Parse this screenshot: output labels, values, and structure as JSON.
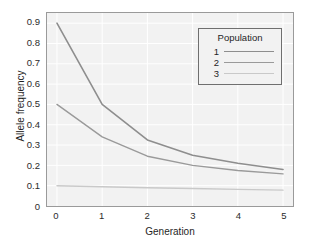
{
  "chart_data": {
    "type": "line",
    "title": "",
    "subtitle": "",
    "xlabel": "Generation",
    "ylabel": "Allele frequency",
    "x": [
      0,
      1,
      2,
      3,
      4,
      5
    ],
    "xticks": [
      "0",
      "1",
      "2",
      "3",
      "4",
      "5"
    ],
    "yticks": [
      "0",
      "0.1",
      "0.2",
      "0.3",
      "0.4",
      "0.5",
      "0.6",
      "0.7",
      "0.8",
      "0.9"
    ],
    "ytick_values": [
      0,
      0.1,
      0.2,
      0.3,
      0.4,
      0.5,
      0.6,
      0.7,
      0.8,
      0.9
    ],
    "xlim": [
      -0.22,
      5.22
    ],
    "ylim": [
      0,
      0.95
    ],
    "grid": true,
    "grid_color": "#ffffff",
    "panel_background": "#f2f2f2",
    "panel_border": "#9a9a9a",
    "legend": {
      "title": "Population",
      "position": "top-right",
      "entries": [
        {
          "label": "1",
          "color": "#8e8e8e",
          "width": 1.6
        },
        {
          "label": "2",
          "color": "#9a9a9a",
          "width": 1.4
        },
        {
          "label": "3",
          "color": "#c9c9c9",
          "width": 1.4
        }
      ]
    },
    "series": [
      {
        "name": "1",
        "color": "#8e8e8e",
        "width": 1.6,
        "values": [
          0.9,
          0.5,
          0.325,
          0.25,
          0.21,
          0.18
        ]
      },
      {
        "name": "2",
        "color": "#9a9a9a",
        "width": 1.4,
        "values": [
          0.5,
          0.34,
          0.245,
          0.2,
          0.175,
          0.158
        ]
      },
      {
        "name": "3",
        "color": "#c9c9c9",
        "width": 1.4,
        "values": [
          0.1,
          0.095,
          0.09,
          0.086,
          0.082,
          0.078
        ]
      }
    ]
  }
}
